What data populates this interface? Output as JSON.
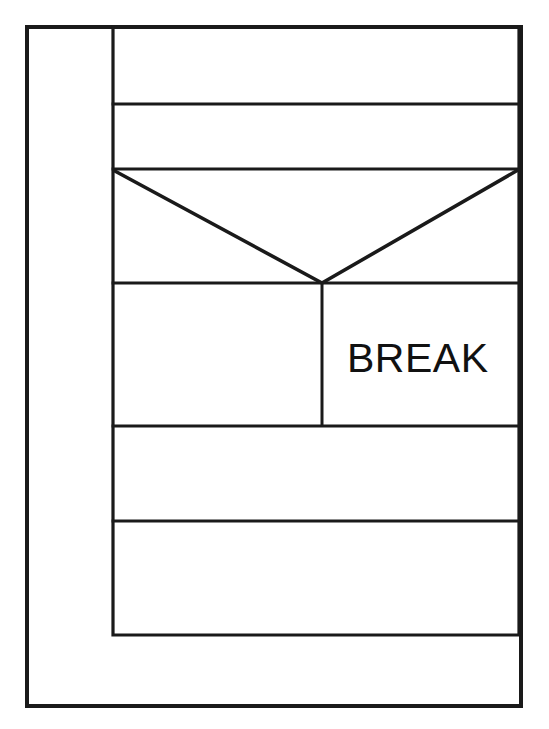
{
  "page": {
    "background_color": "#ffffff",
    "line_color": "#1a1a1a",
    "width": 549,
    "height": 729
  },
  "labels": {
    "break": "BREAK"
  },
  "diagram": {
    "type": "line-drawing",
    "outer_frame": {
      "x1": 27,
      "y1": 27,
      "x2": 521,
      "y2": 706
    },
    "inner_panel": {
      "x1": 113,
      "y1": 27,
      "x2": 519,
      "y2": 635
    },
    "horizontal_dividers": [
      104,
      169,
      283,
      426,
      521
    ],
    "fold_v": {
      "left": {
        "x": 113,
        "y": 170
      },
      "apex": {
        "x": 322,
        "y": 283
      },
      "right": {
        "x": 518,
        "y": 170
      }
    },
    "vertical_seam": {
      "x": 322,
      "y1": 283,
      "y2": 426
    },
    "break_text_anchor": {
      "x": 347,
      "y": 373
    }
  }
}
